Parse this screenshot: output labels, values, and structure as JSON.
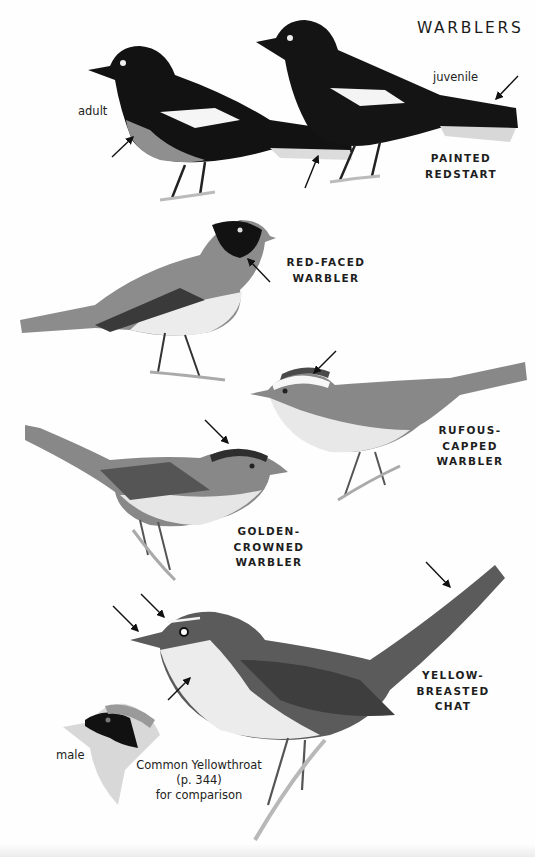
{
  "page": {
    "title": "WARBLERS",
    "species": [
      {
        "id": "painted-redstart",
        "name_lines": [
          "PAINTED",
          "REDSTART"
        ],
        "annotations": [
          "adult",
          "juvenile"
        ]
      },
      {
        "id": "red-faced-warbler",
        "name_lines": [
          "RED-FACED",
          "WARBLER"
        ]
      },
      {
        "id": "rufous-capped-warbler",
        "name_lines": [
          "RUFOUS-",
          "CAPPED",
          "WARBLER"
        ]
      },
      {
        "id": "golden-crowned-warbler",
        "name_lines": [
          "GOLDEN-",
          "CROWNED",
          "WARBLER"
        ]
      },
      {
        "id": "yellow-breasted-chat",
        "name_lines": [
          "YELLOW-",
          "BREASTED",
          "CHAT"
        ]
      }
    ],
    "comparison": {
      "annotation": "male",
      "caption_lines": [
        "Common Yellowthroat",
        "(p. 344)",
        "for comparison"
      ]
    }
  },
  "colors": {
    "background": "#fefefe",
    "ink": "#1e1e1e",
    "black_plumage": "#111111",
    "grey_plumage": "#8a8a8a",
    "light_plumage": "#e2e2e2"
  }
}
